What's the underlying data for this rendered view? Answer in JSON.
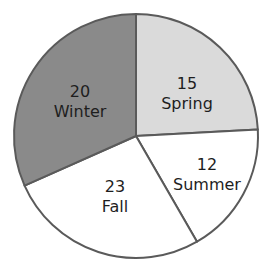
{
  "chart_data": {
    "type": "pie",
    "title": "",
    "categories": [
      "Spring",
      "Summer",
      "Fall",
      "Winter"
    ],
    "values": [
      15,
      12,
      23,
      20
    ],
    "colors": [
      "#dadada",
      "#ffffff",
      "#ffffff",
      "#8a8a8a"
    ],
    "slices": [
      {
        "label": "Spring",
        "value": "15",
        "color": "#dadada",
        "start": 0,
        "end": 87,
        "lx": 187,
        "ly": 89
      },
      {
        "label": "Summer",
        "value": "12",
        "color": "#ffffff",
        "start": 87,
        "end": 150,
        "lx": 207,
        "ly": 170
      },
      {
        "label": "Fall",
        "value": "23",
        "color": "#ffffff",
        "start": 150,
        "end": 246,
        "lx": 115,
        "ly": 192
      },
      {
        "label": "Winter",
        "value": "20",
        "color": "#8a8a8a",
        "start": 246,
        "end": 360,
        "lx": 80,
        "ly": 97
      }
    ],
    "stroke_color": "#5a5a5a",
    "center": [
      136,
      136
    ],
    "radius": 122,
    "legend": "none"
  }
}
